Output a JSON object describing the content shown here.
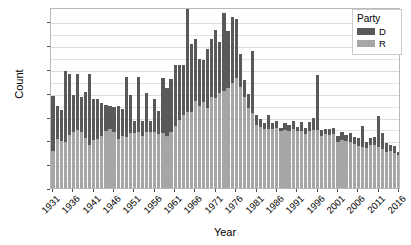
{
  "chart_data": {
    "type": "bar",
    "subtype": "stacked-bar",
    "title": "",
    "xlabel": "Year",
    "ylabel": "Count",
    "ylim": [
      0,
      3800
    ],
    "yticks": [
      0,
      500,
      1000,
      1500,
      2000,
      2500,
      3000,
      3500
    ],
    "ytick_labels": [
      "0",
      "500",
      "1000",
      "1500",
      "2000",
      "2500",
      "3000",
      "3500"
    ],
    "xticks": [
      1931,
      1936,
      1941,
      1946,
      1951,
      1956,
      1961,
      1966,
      1971,
      1976,
      1981,
      1986,
      1991,
      1996,
      2001,
      2006,
      2011,
      2016
    ],
    "xtick_labels": [
      "1931",
      "1936",
      "1941",
      "1946",
      "1951",
      "1956",
      "1961",
      "1966",
      "1971",
      "1976",
      "1981",
      "1986",
      "1991",
      "1996",
      "2001",
      "2006",
      "2011",
      "2016"
    ],
    "grid": true,
    "grid_axis": "y",
    "legend": {
      "title": "Party",
      "position": "top-right",
      "entries": [
        {
          "label": "D",
          "color": "#595959"
        },
        {
          "label": "R",
          "color": "#a6a6a6"
        }
      ]
    },
    "categories": [
      1931,
      1932,
      1933,
      1934,
      1935,
      1936,
      1937,
      1938,
      1939,
      1940,
      1941,
      1942,
      1943,
      1944,
      1945,
      1946,
      1947,
      1948,
      1949,
      1950,
      1951,
      1952,
      1953,
      1954,
      1955,
      1956,
      1957,
      1958,
      1959,
      1960,
      1961,
      1962,
      1963,
      1964,
      1965,
      1966,
      1967,
      1968,
      1969,
      1970,
      1971,
      1972,
      1973,
      1974,
      1975,
      1976,
      1977,
      1978,
      1979,
      1980,
      1981,
      1982,
      1983,
      1984,
      1985,
      1986,
      1987,
      1988,
      1989,
      1990,
      1991,
      1992,
      1993,
      1994,
      1995,
      1996,
      1997,
      1998,
      1999,
      2000,
      2001,
      2002,
      2003,
      2004,
      2005,
      2006,
      2007,
      2008,
      2009,
      2010,
      2011,
      2012,
      2013,
      2014,
      2015,
      2016
    ],
    "series": [
      {
        "name": "R",
        "label": "R",
        "color": "#a6a6a6",
        "values": [
          780,
          1030,
          980,
          960,
          1110,
          1180,
          1210,
          1180,
          1060,
          900,
          1000,
          1030,
          1100,
          1190,
          1240,
          1170,
          1020,
          1090,
          1080,
          1150,
          1160,
          1180,
          1090,
          1170,
          1170,
          1170,
          1130,
          1150,
          1100,
          1170,
          1310,
          1430,
          1530,
          1600,
          1590,
          1820,
          1730,
          1800,
          1680,
          1920,
          1890,
          2000,
          2040,
          2110,
          2200,
          2300,
          2130,
          1910,
          1680,
          1570,
          1330,
          1280,
          1230,
          1240,
          1230,
          1260,
          1190,
          1220,
          1200,
          1240,
          1190,
          1190,
          1130,
          1200,
          1210,
          1220,
          1090,
          1130,
          1120,
          1130,
          960,
          1010,
          980,
          970,
          930,
          890,
          860,
          830,
          910,
          900,
          860,
          810,
          760,
          780,
          740,
          700
        ],
        "stack_order": 0
      },
      {
        "name": "D",
        "label": "D",
        "color": "#595959",
        "values": [
          1160,
          690,
          660,
          1490,
          1290,
          770,
          1180,
          730,
          950,
          1490,
          860,
          830,
          690,
          560,
          490,
          540,
          710,
          560,
          1250,
          800,
          250,
          1160,
          320,
          830,
          240,
          700,
          480,
          1150,
          1010,
          1110,
          1270,
          1160,
          1050,
          2170,
          1440,
          1310,
          970,
          890,
          1240,
          1200,
          1430,
          1060,
          1630,
          1180,
          1390,
          1250,
          680,
          350,
          300,
          1300,
          200,
          170,
          130,
          290,
          140,
          150,
          70,
          140,
          120,
          170,
          100,
          200,
          130,
          180,
          250,
          1160,
          120,
          110,
          120,
          120,
          130,
          160,
          130,
          180,
          150,
          160,
          440,
          130,
          130,
          180,
          650,
          350,
          190,
          130,
          150,
          60
        ],
        "stack_order": 1
      }
    ],
    "totals": [
      1940,
      1720,
      1640,
      2450,
      2400,
      1950,
      2390,
      1910,
      2010,
      2390,
      1860,
      1860,
      1790,
      1750,
      1730,
      1710,
      1730,
      1650,
      2330,
      1950,
      1410,
      2340,
      1410,
      2000,
      1410,
      1870,
      1610,
      2300,
      2110,
      2280,
      2580,
      2590,
      2580,
      3770,
      3030,
      3130,
      2700,
      2690,
      2920,
      3120,
      3320,
      3060,
      3670,
      3290,
      3590,
      3550,
      2810,
      2260,
      1980,
      2870,
      1530,
      1450,
      1360,
      1530,
      1370,
      1410,
      1260,
      1360,
      1320,
      1410,
      1290,
      1390,
      1260,
      1380,
      1460,
      2380,
      1210,
      1240,
      1240,
      1250,
      1090,
      1170,
      1110,
      1150,
      1080,
      1050,
      1300,
      960,
      1040,
      1080,
      1510,
      1110,
      950,
      910,
      890,
      760
    ]
  }
}
